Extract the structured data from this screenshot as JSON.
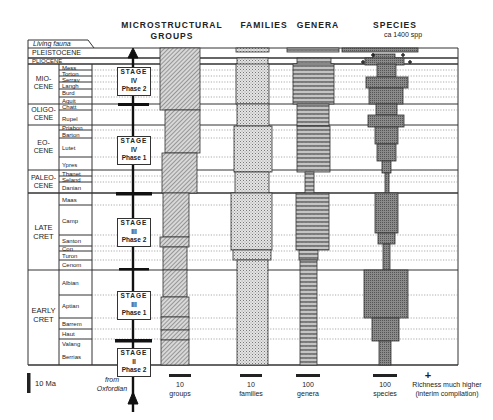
{
  "headers": {
    "groups_line1": "MICROSTRUCTURAL",
    "groups_line2": "GROUPS",
    "families": "FAMILIES",
    "genera": "GENERA",
    "species": "SPECIES",
    "species_note": "ca 1400 spp"
  },
  "timescale": {
    "living_fauna": "Living fauna",
    "epochs": [
      {
        "label": "PLEISTOCENE"
      },
      {
        "label": "PLIOCENE"
      },
      {
        "label": "MIO-\nCENE",
        "l1": "MIO-",
        "l2": "CENE"
      },
      {
        "label": "OLIGO-\nCENE",
        "l1": "OLIGO-",
        "l2": "CENE"
      },
      {
        "label": "EO-\nCENE",
        "l1": "EO-",
        "l2": "CENE"
      },
      {
        "label": "PALEO-\nCENE",
        "l1": "PALEO-",
        "l2": "CENE"
      },
      {
        "label": "LATE\nCRET",
        "l1": "LATE",
        "l2": "CRET"
      },
      {
        "label": "EARLY\nCRET",
        "l1": "EARLY",
        "l2": "CRET"
      }
    ],
    "stages": [
      "Mess",
      "Torton",
      "Serrav",
      "Langh",
      "Burd",
      "Aquit",
      "Chatt",
      "Rupel",
      "Priabon",
      "Barton",
      "Lutet",
      "Ypres",
      "Thanet",
      "Seland",
      "Danian",
      "Maas",
      "Camp",
      "Santon",
      "Con",
      "Turon",
      "Cenom",
      "Albian",
      "Aptian",
      "Barrem",
      "Haut",
      "Valang",
      "Berrias"
    ]
  },
  "microstructural_stages": [
    {
      "l1": "STAGE",
      "l2": "IV",
      "l3": "Phase  2"
    },
    {
      "l1": "STAGE",
      "l2": "IV",
      "l3": "Phase  1"
    },
    {
      "l1": "STAGE",
      "l2": "III",
      "l3": "Phase  2"
    },
    {
      "l1": "STAGE",
      "l2": "III",
      "l3": "Phase  1"
    },
    {
      "l1": "STAGE",
      "l2": "II",
      "l3": "Phase  2"
    }
  ],
  "legend": {
    "scale": "10 Ma",
    "from_l1": "from",
    "from_l2": "Oxfordian",
    "groups_n": "10",
    "groups_u": "groups",
    "families_n": "10",
    "families_u": "families",
    "genera_n": "100",
    "genera_u": "genera",
    "species_n": "100",
    "species_u": "species",
    "plus_symbol": "+",
    "plus_l1": "Richness much higher",
    "plus_l2": "(interim compilation)"
  },
  "colors": {
    "line": "#333333",
    "groups_fill": "#b8b8b8",
    "families_fill": "#d4d4d4",
    "genera_fill": "#a8a8a8",
    "species_fill": "#7a7a7a"
  }
}
